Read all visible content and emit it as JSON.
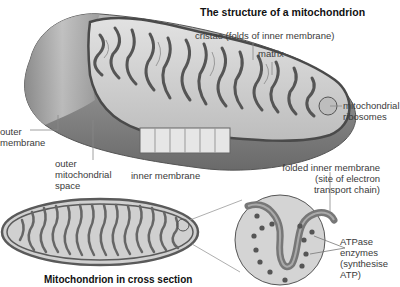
{
  "title": "The structure of a mitochondrion",
  "caption": "Mitochondrion in cross section",
  "labels": {
    "cristae": "cristae (folds of inner membrane)",
    "matrix": "matrix",
    "ribosomes_1": "mitochondrial",
    "ribosomes_2": "ribosomes",
    "outer_membrane_1": "outer",
    "outer_membrane_2": "membrane",
    "outer_space_1": "outer",
    "outer_space_2": "mitochondrial",
    "outer_space_3": "space",
    "inner_membrane": "inner membrane",
    "folded_1": "folded inner membrane",
    "folded_2": "(site of electron",
    "folded_3": "transport chain)",
    "atpase_1": "ATPase",
    "atpase_2": "enzymes",
    "atpase_3": "(synthesise",
    "atpase_4": "ATP)"
  },
  "colors": {
    "membrane_dark": "#6e6e6e",
    "body_gray": "#8a8a8a",
    "matrix_light": "#d6d6d6",
    "leader_line": "#888888"
  }
}
